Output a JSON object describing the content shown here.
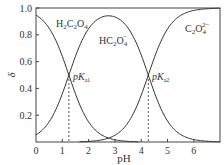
{
  "chart_data": {
    "type": "line",
    "title": "",
    "xlabel": "pH",
    "ylabel": "δ",
    "xlim": [
      0,
      7
    ],
    "ylim": [
      0,
      1.0
    ],
    "x_ticks": [
      "0",
      "1",
      "2",
      "3",
      "4",
      "5",
      "6"
    ],
    "y_ticks": [
      "0.2",
      "0.4",
      "0.6",
      "0.8",
      "1.0"
    ],
    "grid": false,
    "legend": "inline labels",
    "pKa1": 1.25,
    "pKa2": 4.27,
    "annotations": [
      {
        "text": "pK",
        "sub": "a1",
        "x": 1.25,
        "y": 0.5
      },
      {
        "text": "pK",
        "sub": "a2",
        "x": 4.27,
        "y": 0.5
      }
    ],
    "series": [
      {
        "name": "H2C2O4",
        "label_main": "H",
        "points": [
          [
            0,
            0.947
          ],
          [
            0.5,
            0.849
          ],
          [
            1.0,
            0.64
          ],
          [
            1.25,
            0.5
          ],
          [
            1.5,
            0.36
          ],
          [
            2.0,
            0.15
          ],
          [
            2.5,
            0.053
          ],
          [
            3.0,
            0.017
          ],
          [
            3.5,
            0.005
          ],
          [
            4.0,
            0.001
          ],
          [
            5,
            0
          ],
          [
            6,
            0
          ],
          [
            7,
            0
          ]
        ]
      },
      {
        "name": "HC2O4-",
        "points": [
          [
            0,
            0.053
          ],
          [
            0.5,
            0.151
          ],
          [
            1.0,
            0.36
          ],
          [
            1.25,
            0.499
          ],
          [
            1.5,
            0.637
          ],
          [
            2.0,
            0.84
          ],
          [
            2.5,
            0.928
          ],
          [
            3.0,
            0.932
          ],
          [
            3.5,
            0.85
          ],
          [
            4.0,
            0.65
          ],
          [
            4.27,
            0.5
          ],
          [
            4.5,
            0.37
          ],
          [
            5.0,
            0.157
          ],
          [
            5.5,
            0.055
          ],
          [
            6.0,
            0.018
          ],
          [
            6.5,
            0.006
          ],
          [
            7.0,
            0.002
          ]
        ]
      },
      {
        "name": "C2O4 2-",
        "points": [
          [
            0,
            0
          ],
          [
            1,
            0
          ],
          [
            2,
            0.01
          ],
          [
            2.5,
            0.02
          ],
          [
            3.0,
            0.051
          ],
          [
            3.5,
            0.145
          ],
          [
            4.0,
            0.349
          ],
          [
            4.27,
            0.5
          ],
          [
            4.5,
            0.63
          ],
          [
            5.0,
            0.843
          ],
          [
            5.5,
            0.944
          ],
          [
            6.0,
            0.982
          ],
          [
            6.5,
            0.994
          ],
          [
            7.0,
            0.998
          ]
        ]
      }
    ]
  },
  "labels": {
    "h2c2o4": {
      "a": "H",
      "s1": "2",
      "b": "C",
      "s2": "2",
      "c": "O",
      "s3": "4"
    },
    "hc2o4": {
      "a": "HC",
      "s1": "2",
      "b": "O",
      "s2": "4",
      "sup": "−"
    },
    "c2o4": {
      "a": "C",
      "s1": "2",
      "b": "O",
      "s2": "4",
      "sup": "2−"
    },
    "pka1": {
      "main": "pK",
      "sub": "a1"
    },
    "pka2": {
      "main": "pK",
      "sub": "a2"
    },
    "x_title": "pH",
    "y_title": "δ"
  }
}
